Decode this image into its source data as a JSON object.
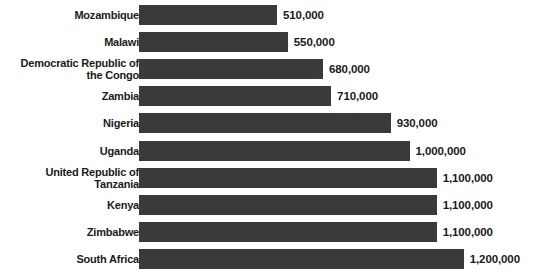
{
  "chart_data": {
    "type": "bar",
    "orientation": "horizontal",
    "title": "",
    "xlabel": "",
    "ylabel": "",
    "grid": false,
    "legend": null,
    "xlim": [
      0,
      1200000
    ],
    "value_label_format": "comma-separated integers",
    "categories": [
      "Mozambique",
      "Malawi",
      "Democratic Republic of the Congo",
      "Zambia",
      "Nigeria",
      "Uganda",
      "United Republic of Tanzania",
      "Kenya",
      "Zimbabwe",
      "South Africa"
    ],
    "values": [
      510000,
      550000,
      680000,
      710000,
      930000,
      1000000,
      1100000,
      1100000,
      1100000,
      1200000
    ],
    "value_labels": [
      "510,000",
      "550,000",
      "680,000",
      "710,000",
      "930,000",
      "1,000,000",
      "1,100,000",
      "1,100,000",
      "1,100,000",
      "1,200,000"
    ],
    "category_labels_wrapped": [
      "Mozambique",
      "Malawi",
      "Democratic Republic of\nthe Congo",
      "Zambia",
      "Nigeria",
      "Uganda",
      "United Republic of\nTanzania",
      "Kenya",
      "Zimbabwe",
      "South Africa"
    ]
  },
  "colors": {
    "bar": "#3a3a3a",
    "text": "#1a1a1a",
    "background": "#ffffff"
  }
}
